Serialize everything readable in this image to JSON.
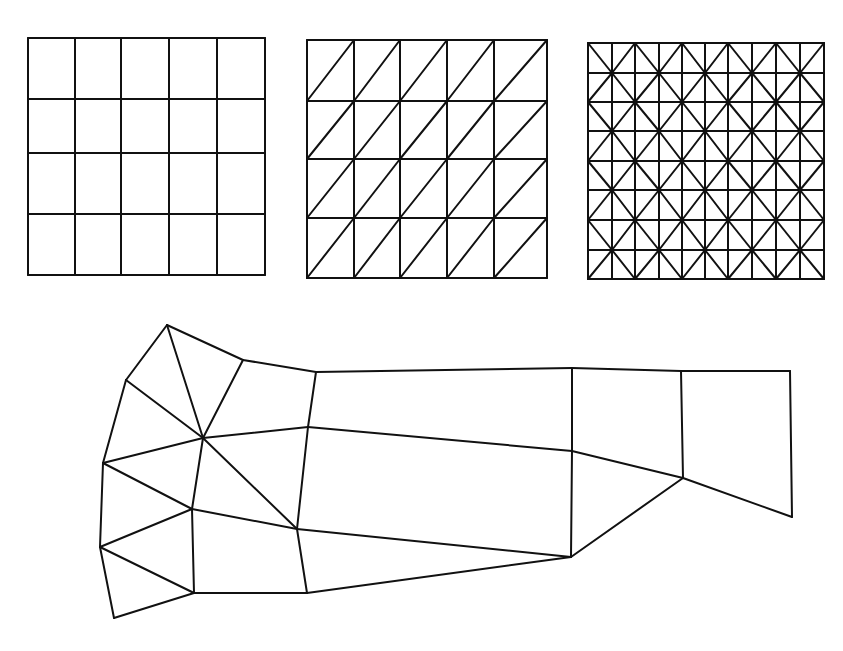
{
  "figure": {
    "line_color": "#111111",
    "background": "#ffffff"
  },
  "meshes": [
    {
      "id": "quad-grid",
      "type": "structured-quadrilateral",
      "x_lines": [
        28,
        75,
        121,
        169,
        217,
        265
      ],
      "y_lines": [
        38,
        99,
        153,
        214,
        275
      ],
      "diagonals": "none"
    },
    {
      "id": "triangle-grid",
      "type": "structured-triangular",
      "x_lines": [
        307,
        354,
        400,
        447,
        494,
        547
      ],
      "y_lines": [
        40,
        101,
        159,
        218,
        278
      ],
      "diagonals": "slash"
    },
    {
      "id": "crisscross-grid",
      "type": "structured-crisscross-triangular",
      "x_lines": [
        588,
        612,
        635,
        659,
        682,
        705,
        728,
        752,
        776,
        800,
        824
      ],
      "y_lines": [
        43,
        73,
        102,
        131,
        161,
        190,
        220,
        250,
        279
      ],
      "diagonals": "checkerboard"
    }
  ],
  "unstructured_mesh": {
    "id": "unstructured-mixed-mesh",
    "nodes": {
      "A": [
        167,
        325
      ],
      "B": [
        126,
        380
      ],
      "C": [
        243,
        360
      ],
      "D": [
        316,
        372
      ],
      "H": [
        203,
        438
      ],
      "E": [
        103,
        463
      ],
      "F": [
        308,
        427
      ],
      "G": [
        192,
        509
      ],
      "I": [
        297,
        529
      ],
      "J": [
        100,
        547
      ],
      "K": [
        194,
        593
      ],
      "L": [
        307,
        593
      ],
      "M": [
        114,
        618
      ],
      "N": [
        572,
        368
      ],
      "O": [
        572,
        451
      ],
      "P": [
        571,
        557
      ],
      "Q": [
        681,
        371
      ],
      "R": [
        790,
        371
      ],
      "S": [
        683,
        478
      ],
      "T": [
        792,
        517
      ]
    },
    "edges": [
      [
        "A",
        "B"
      ],
      [
        "A",
        "C"
      ],
      [
        "A",
        "H"
      ],
      [
        "B",
        "H"
      ],
      [
        "B",
        "E"
      ],
      [
        "C",
        "H"
      ],
      [
        "C",
        "D"
      ],
      [
        "D",
        "F"
      ],
      [
        "H",
        "F"
      ],
      [
        "H",
        "E"
      ],
      [
        "H",
        "G"
      ],
      [
        "H",
        "I"
      ],
      [
        "E",
        "G"
      ],
      [
        "E",
        "J"
      ],
      [
        "G",
        "J"
      ],
      [
        "G",
        "I"
      ],
      [
        "G",
        "K"
      ],
      [
        "J",
        "K"
      ],
      [
        "J",
        "M"
      ],
      [
        "M",
        "K"
      ],
      [
        "K",
        "L"
      ],
      [
        "F",
        "I"
      ],
      [
        "I",
        "L"
      ],
      [
        "D",
        "N"
      ],
      [
        "F",
        "O"
      ],
      [
        "I",
        "P"
      ],
      [
        "L",
        "P"
      ],
      [
        "N",
        "O"
      ],
      [
        "O",
        "P"
      ],
      [
        "N",
        "Q"
      ],
      [
        "Q",
        "R"
      ],
      [
        "Q",
        "S"
      ],
      [
        "O",
        "S"
      ],
      [
        "P",
        "S"
      ],
      [
        "S",
        "T"
      ],
      [
        "R",
        "T"
      ]
    ]
  }
}
